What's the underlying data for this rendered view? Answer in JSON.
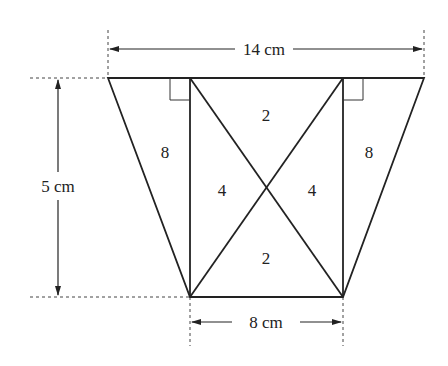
{
  "diagram": {
    "type": "trapezoid-decomposition",
    "top_width_label": "14 cm",
    "bottom_width_label": "8 cm",
    "height_label": "5 cm",
    "regions": {
      "left_triangle": "8",
      "right_triangle": "8",
      "top_triangle": "2",
      "bottom_triangle": "2",
      "left_inner_triangle": "4",
      "right_inner_triangle": "4"
    },
    "line_color": "#222222"
  }
}
